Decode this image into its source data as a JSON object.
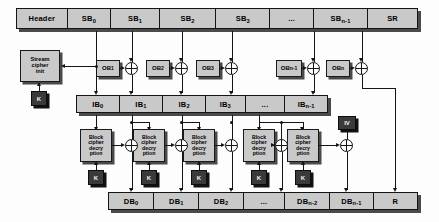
{
  "diagram": {
    "colors": {
      "box_fill": "#c9c9c9",
      "dark_fill": "#3a3a3a",
      "outline": "#151515",
      "shadow": "#4a4a4a",
      "page": "#fdfdfd"
    }
  },
  "top_bar": {
    "name": "ciphertext-packet-bar",
    "cells": [
      {
        "label": "Header",
        "sub": ""
      },
      {
        "label": "SB",
        "sub": "0"
      },
      {
        "label": "SB",
        "sub": "1"
      },
      {
        "label": "SB",
        "sub": "2"
      },
      {
        "label": "SB",
        "sub": "3"
      },
      {
        "label": "...",
        "sub": ""
      },
      {
        "label": "SB",
        "sub": "n-1"
      },
      {
        "label": "SR",
        "sub": ""
      }
    ]
  },
  "middle_bar": {
    "name": "input-block-bar",
    "cells": [
      {
        "label": "IB",
        "sub": "0"
      },
      {
        "label": "IB",
        "sub": "1"
      },
      {
        "label": "IB",
        "sub": "2"
      },
      {
        "label": "IB",
        "sub": "3"
      },
      {
        "label": "...",
        "sub": ""
      },
      {
        "label": "IB",
        "sub": "n-1"
      }
    ]
  },
  "bottom_bar": {
    "name": "decrypted-block-bar",
    "cells": [
      {
        "label": "DB",
        "sub": "0"
      },
      {
        "label": "DB",
        "sub": "1"
      },
      {
        "label": "DB",
        "sub": "2"
      },
      {
        "label": "...",
        "sub": ""
      },
      {
        "label": "DB",
        "sub": "n-2"
      },
      {
        "label": "DB",
        "sub": "n-1"
      },
      {
        "label": "R",
        "sub": ""
      }
    ]
  },
  "stream_cipher": {
    "name": "stream-cipher-init-block",
    "label_line1": "Stream",
    "label_line2": "cipher",
    "label_line3": "init",
    "key_label": "K"
  },
  "output_blocks": [
    {
      "label": "OB",
      "sub": "1"
    },
    {
      "label": "OB",
      "sub": "2"
    },
    {
      "label": "OB",
      "sub": "3"
    },
    {
      "label": "OB",
      "sub": "n-1"
    },
    {
      "label": "OB",
      "sub": "n"
    }
  ],
  "cipher_blocks": [
    {
      "l1": "Block",
      "l2": "cipher",
      "l3": "decry",
      "l4": "ption",
      "key": "K"
    },
    {
      "l1": "Block",
      "l2": "cipher",
      "l3": "decry",
      "l4": "ption",
      "key": "K"
    },
    {
      "l1": "Block",
      "l2": "cipher",
      "l3": "decry",
      "l4": "ption",
      "key": "K"
    },
    {
      "l1": "Block",
      "l2": "cipher",
      "l3": "decry",
      "l4": "ption",
      "key": "K"
    },
    {
      "l1": "Block",
      "l2": "cipher",
      "l3": "decry",
      "l4": "ption",
      "key": "K"
    }
  ],
  "iv_block": {
    "name": "initialization-vector-block",
    "label": "IV"
  }
}
